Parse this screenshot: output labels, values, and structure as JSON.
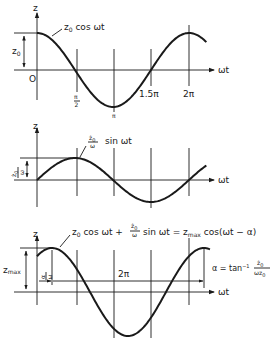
{
  "panels": [
    {
      "id": "cos",
      "axis_y_label": "z",
      "axis_x_label": "ωt",
      "origin_label": "O",
      "amplitude_label": "z",
      "amplitude_sub": "0",
      "curve_label": "z",
      "curve_label_sub": "0",
      "curve_label_rest": " cos ωt",
      "tick_labels": [
        "π/2",
        "π",
        "1.5π",
        "2π"
      ],
      "tick_pi_top": "π",
      "tick_pi_bottom": "2",
      "tick_values": [
        1.5708,
        3.1416,
        4.7124,
        6.2832
      ]
    },
    {
      "id": "sin",
      "axis_y_label": "z",
      "axis_x_label": "ωt",
      "amplitude_num": "ż",
      "amplitude_num_sub": "0",
      "amplitude_den": "ω",
      "curve_label_num": "ż",
      "curve_label_num_sub": "0",
      "curve_label_den": "ω",
      "curve_label_rest": "sin ωt"
    },
    {
      "id": "sum",
      "axis_y_label": "z",
      "axis_x_label": "ωt",
      "amplitude_label": "z",
      "amplitude_sub": "max",
      "phase_num": "α",
      "phase_den": "ω",
      "period_label": "2π",
      "eq_part1": "z",
      "eq_part1_sub": "0",
      "eq_part1_rest": " cos ωt + ",
      "eq_frac_num": "ż",
      "eq_frac_num_sub": "0",
      "eq_frac_den": "ω",
      "eq_part2": " sin ωt = z",
      "eq_part2_sub": "max",
      "eq_part2_rest": " cos(ωt − α)",
      "alpha_def_lhs": "α = tan",
      "alpha_def_sup": "−1",
      "alpha_def_num": "ż",
      "alpha_def_num_sub": "0",
      "alpha_def_den": "ωz",
      "alpha_def_den_sub": "0"
    }
  ]
}
